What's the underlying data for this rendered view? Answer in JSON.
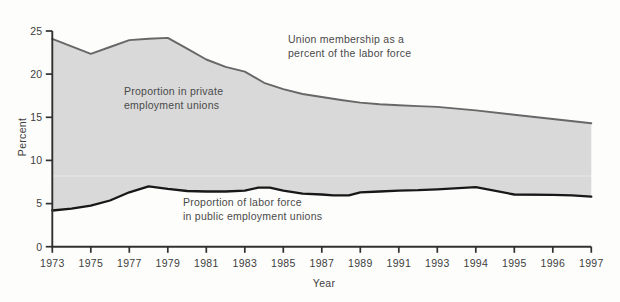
{
  "chart_data": {
    "type": "area",
    "title": "",
    "xlabel": "Year",
    "ylabel": "Percent",
    "ylim": [
      0,
      25
    ],
    "yticks": [
      0,
      5,
      10,
      15,
      20,
      25
    ],
    "xticks": [
      1973,
      1975,
      1977,
      1979,
      1981,
      1983,
      1985,
      1987,
      1989,
      1991,
      1993,
      1994,
      1995,
      1996,
      1997
    ],
    "x_axis_note": "evenly spaced ticks: every 2 years 1973-1993, then yearly 1994-1997",
    "grid": "off",
    "legend": "inline text annotations",
    "faint_band_y_value": 8.2,
    "series": [
      {
        "name": "Union membership as a percent of the labor force",
        "points": [
          [
            1973,
            24.1
          ],
          [
            1975,
            22.35
          ],
          [
            1976,
            23.15
          ],
          [
            1977,
            23.95
          ],
          [
            1978,
            24.1
          ],
          [
            1979,
            24.2
          ],
          [
            1980,
            22.95
          ],
          [
            1981,
            21.7
          ],
          [
            1982,
            20.85
          ],
          [
            1983,
            20.3
          ],
          [
            1984,
            19.0
          ],
          [
            1985,
            18.25
          ],
          [
            1986,
            17.7
          ],
          [
            1987,
            17.35
          ],
          [
            1988,
            17.0
          ],
          [
            1989,
            16.7
          ],
          [
            1990,
            16.5
          ],
          [
            1991,
            16.4
          ],
          [
            1992,
            16.3
          ],
          [
            1993,
            16.2
          ],
          [
            1994,
            15.8
          ],
          [
            1995,
            15.3
          ],
          [
            1996,
            14.8
          ],
          [
            1997,
            14.3
          ]
        ]
      },
      {
        "name": "Proportion of labor force in public employment unions",
        "points": [
          [
            1973,
            4.2
          ],
          [
            1974,
            4.4
          ],
          [
            1975,
            4.75
          ],
          [
            1976,
            5.35
          ],
          [
            1977,
            6.3
          ],
          [
            1978,
            7.0
          ],
          [
            1979,
            6.7
          ],
          [
            1980,
            6.45
          ],
          [
            1981,
            6.4
          ],
          [
            1982,
            6.4
          ],
          [
            1983,
            6.5
          ],
          [
            1983.7,
            6.85
          ],
          [
            1984.3,
            6.85
          ],
          [
            1985,
            6.5
          ],
          [
            1986,
            6.15
          ],
          [
            1987,
            6.05
          ],
          [
            1987.6,
            5.95
          ],
          [
            1988.4,
            5.95
          ],
          [
            1989,
            6.3
          ],
          [
            1990,
            6.4
          ],
          [
            1991,
            6.5
          ],
          [
            1992,
            6.55
          ],
          [
            1993,
            6.65
          ],
          [
            1994,
            6.9
          ],
          [
            1995,
            6.05
          ],
          [
            1996,
            6.0
          ],
          [
            1996.5,
            5.95
          ],
          [
            1997,
            5.8
          ]
        ]
      }
    ],
    "area_label": "Proportion in private employment unions",
    "annotations": [
      {
        "id": "union-membership",
        "lines": [
          "Union membership as a",
          "percent of the labor force"
        ]
      },
      {
        "id": "private-unions",
        "lines": [
          "Proportion in private",
          "employment unions"
        ]
      },
      {
        "id": "public-unions",
        "lines": [
          "Proportion of labor force",
          "in public employment unions"
        ]
      }
    ],
    "colors": {
      "area": "#d9d9d9",
      "top_line": "#676767",
      "bottom_line": "#181818",
      "axis": "#303030",
      "band": "#e7e7e7",
      "text": "#4a4a4a",
      "background": "#fdfdfc"
    }
  }
}
